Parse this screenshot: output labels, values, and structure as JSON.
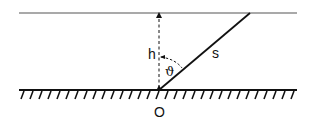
{
  "diagram": {
    "labels": {
      "height": "h",
      "length": "s",
      "angle": "ϑ",
      "origin": "O"
    },
    "colors": {
      "line": "#111111",
      "top_line": "#555555",
      "background": "#ffffff"
    }
  }
}
